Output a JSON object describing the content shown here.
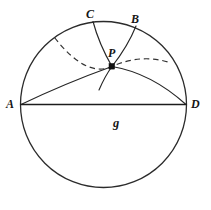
{
  "figure": {
    "background_color": "#ffffff",
    "ink_color": "#1c1c1c",
    "labels": {
      "A": "A",
      "B": "B",
      "C": "C",
      "D": "D",
      "P": "P",
      "g": "g"
    },
    "boundary_circle": {
      "cx": 103.5,
      "cy": 104.5,
      "r": 83.0,
      "style": "solid"
    },
    "points": {
      "A": {
        "x": 21.0,
        "y": 104.5
      },
      "B": {
        "x": 136.0,
        "y": 26.0
      },
      "C": {
        "x": 93.0,
        "y": 21.5
      },
      "D": {
        "x": 186.0,
        "y": 104.5
      },
      "P": {
        "x": 112.0,
        "y": 66.5
      }
    },
    "line_g": {
      "label": "g",
      "from": "A",
      "to": "D",
      "style": "solid",
      "is_diameter": true
    },
    "arcs": [
      {
        "name": "arc-P-A",
        "from": "P",
        "to": "A",
        "style": "solid",
        "bulge": "concave-down"
      },
      {
        "name": "arc-P-D",
        "from": "P",
        "to": "D",
        "style": "solid",
        "bulge": "concave-down"
      },
      {
        "name": "arc-P-C",
        "from": "P",
        "to": "C",
        "style": "solid",
        "bulge": "slight"
      },
      {
        "name": "arc-P-B",
        "from": "P",
        "to": "B",
        "style": "solid",
        "bulge": "slight"
      },
      {
        "name": "arc-dashed-through-P",
        "from": "circle-upper-left",
        "to": "circle-upper-right",
        "style": "dashed",
        "bulge": "concave-up"
      }
    ]
  }
}
